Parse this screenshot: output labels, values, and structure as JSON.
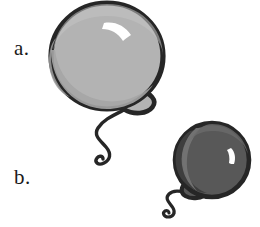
{
  "figure": {
    "background_color": "#ffffff",
    "width": 260,
    "height": 227
  },
  "labels": [
    {
      "id": "a",
      "text": "a.",
      "x": 14,
      "y": 38
    },
    {
      "id": "b",
      "text": "b.",
      "x": 14,
      "y": 167
    }
  ],
  "label_a": "a.",
  "label_b": "b.",
  "colors": {
    "outline": "#262626",
    "balloon_a_body": "#b3b3b3",
    "balloon_a_shade": "#a3a3a3",
    "balloon_a_highlight": "#ffffff",
    "balloon_b_body": "#585858",
    "balloon_b_shade": "#454545",
    "balloon_b_rim": "#6e6e6e",
    "balloon_b_highlight": "#ffffff",
    "string": "#262626",
    "background": "#ffffff"
  },
  "objects": [
    {
      "name": "balloon-a",
      "label": "a.",
      "size": "large",
      "fill": "#b3b3b3",
      "center_x": 107,
      "center_y": 56,
      "radius_x": 57,
      "radius_y": 54,
      "knot_x": 133,
      "knot_y": 104,
      "highlight": "crescent",
      "string": "wavy-curl"
    },
    {
      "name": "balloon-b",
      "label": "b.",
      "size": "small",
      "fill": "#585858",
      "center_x": 212,
      "center_y": 160,
      "radius_x": 38,
      "radius_y": 38,
      "knot_x": 189,
      "knot_y": 191,
      "highlight": "small-crescent",
      "string": "wavy-curl"
    }
  ]
}
